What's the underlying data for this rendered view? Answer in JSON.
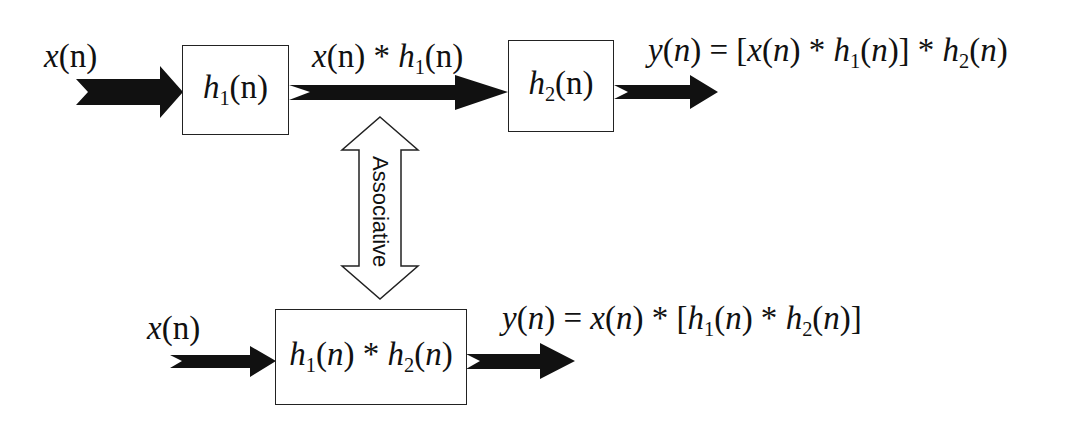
{
  "diagram": {
    "type": "block-diagram",
    "topic": "Associative property of convolution (LTI systems in cascade)",
    "top_chain": {
      "input_label": {
        "base": "x",
        "arg": "(n)"
      },
      "block1": {
        "base": "h",
        "sub": "1",
        "arg": "(n)"
      },
      "intermediate_label": {
        "text": "x(n) * h1(n)",
        "p1": "x",
        "p2": "(n) * ",
        "p3": "h",
        "sub": "1",
        "p4": "(n)"
      },
      "block2": {
        "base": "h",
        "sub": "2",
        "arg": "(n)"
      },
      "output_label": {
        "text": "y(n) = [x(n) * h1(n)] * h2(n)"
      }
    },
    "relation": {
      "label": "Associative",
      "shape": "double-headed-vertical-arrow"
    },
    "bottom_chain": {
      "input_label": {
        "base": "x",
        "arg": "(n)"
      },
      "block": {
        "text": "h1(n) * h2(n)"
      },
      "output_label": {
        "text": "y(n) = x(n) * [h1(n) * h2(n)]"
      }
    },
    "colors": {
      "arrow_fill": "#111111",
      "box_border": "#222222",
      "background": "#ffffff"
    }
  }
}
